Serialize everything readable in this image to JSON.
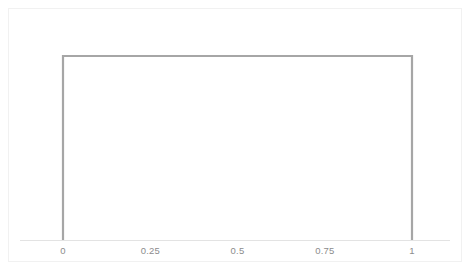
{
  "chart_data": {
    "type": "line",
    "title": "",
    "subtitle": "",
    "xlabel": "",
    "ylabel": "",
    "legend": [],
    "grid": false,
    "xlim": [
      -0.075,
      1.075
    ],
    "ylim": [
      0,
      1.15
    ],
    "xticks": [
      "0",
      "0.25",
      "0.5",
      "0.75",
      "1"
    ],
    "xtick_values": [
      0,
      0.25,
      0.5,
      0.75,
      1
    ],
    "yticks": [],
    "series": [
      {
        "name": "uniform-pdf",
        "x": [
          0,
          0,
          1,
          1
        ],
        "values": [
          0,
          1,
          1,
          0
        ],
        "color": "#a6a6a6",
        "line_width": 2.2
      }
    ],
    "axis_line_color": "#e3e3e3",
    "annotations": []
  },
  "chart": {
    "frame_color": "#f1f1f1",
    "background": "#ffffff",
    "tick_label_color": "#8c8c8c"
  }
}
